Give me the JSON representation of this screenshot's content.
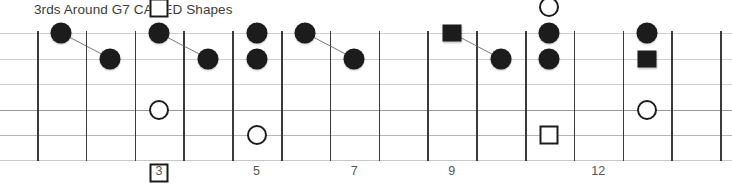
{
  "title": "3rds Around G7 CAGED Shapes",
  "diagram": {
    "type": "guitar-fretboard",
    "fret_count": 14,
    "string_count": 6,
    "fret_x0": 37,
    "fret_spacing": 48.8,
    "string_y": [
      33,
      58.5,
      84,
      110,
      135,
      160
    ],
    "board_top": 31,
    "board_bottom": 161,
    "colors": {
      "marker_fill": "#1c1c1c",
      "marker_outline": "#1c1c1c",
      "fret_line": "#3a3a3a",
      "string_line": "#cfcfcf",
      "title_text": "#3c3c3c",
      "fretnum_text": "#555555",
      "background": "#ffffff"
    },
    "fret_numbers": [
      {
        "label": "3",
        "fret": 3
      },
      {
        "label": "5",
        "fret": 5
      },
      {
        "label": "7",
        "fret": 7
      },
      {
        "label": "9",
        "fret": 9
      },
      {
        "label": "12",
        "fret": 12
      }
    ],
    "markers": [
      {
        "name": "filled-circle-f1-s1",
        "fret": 1,
        "string": 1,
        "shape": "circle-filled",
        "offset_y": 0
      },
      {
        "name": "filled-circle-f2-s2",
        "fret": 2,
        "string": 2,
        "shape": "circle-filled",
        "offset_y": 0
      },
      {
        "name": "open-square-f3-above",
        "fret": 3,
        "string": 1,
        "shape": "square-open",
        "offset_y": -25
      },
      {
        "name": "filled-circle-f3-s1",
        "fret": 3,
        "string": 1,
        "shape": "circle-filled",
        "offset_y": 0
      },
      {
        "name": "open-circle-f3-s4",
        "fret": 3,
        "string": 4,
        "shape": "circle-open",
        "offset_y": 0
      },
      {
        "name": "open-square-f3-below",
        "fret": 3,
        "string": 6,
        "shape": "square-open",
        "offset_y": 13
      },
      {
        "name": "filled-circle-f4-s2",
        "fret": 4,
        "string": 2,
        "shape": "circle-filled",
        "offset_y": 0
      },
      {
        "name": "filled-circle-f5-s1",
        "fret": 5,
        "string": 1,
        "shape": "circle-filled",
        "offset_y": 0
      },
      {
        "name": "filled-circle-f5-s2",
        "fret": 5,
        "string": 2,
        "shape": "circle-filled",
        "offset_y": 0
      },
      {
        "name": "open-circle-f5-s5",
        "fret": 5,
        "string": 5,
        "shape": "circle-open",
        "offset_y": 0
      },
      {
        "name": "filled-circle-f6-s1",
        "fret": 6,
        "string": 1,
        "shape": "circle-filled",
        "offset_y": 0
      },
      {
        "name": "filled-circle-f7-s2",
        "fret": 7,
        "string": 2,
        "shape": "circle-filled",
        "offset_y": 0
      },
      {
        "name": "filled-square-f9-s1",
        "fret": 9,
        "string": 1,
        "shape": "square-filled",
        "offset_y": 0
      },
      {
        "name": "filled-circle-f10-s2",
        "fret": 10,
        "string": 2,
        "shape": "circle-filled",
        "offset_y": 0
      },
      {
        "name": "open-circle-f11-above",
        "fret": 11,
        "string": 1,
        "shape": "circle-open",
        "offset_y": -26
      },
      {
        "name": "filled-circle-f11-s1",
        "fret": 11,
        "string": 1,
        "shape": "circle-filled",
        "offset_y": 0
      },
      {
        "name": "filled-circle-f11-s2",
        "fret": 11,
        "string": 2,
        "shape": "circle-filled",
        "offset_y": 0
      },
      {
        "name": "open-square-f11-s5",
        "fret": 11,
        "string": 5,
        "shape": "square-open",
        "offset_y": 0
      },
      {
        "name": "filled-circle-f13-s1",
        "fret": 13,
        "string": 1,
        "shape": "circle-filled",
        "offset_y": 0
      },
      {
        "name": "filled-square-f13-s2",
        "fret": 13,
        "string": 2,
        "shape": "square-filled",
        "offset_y": 0
      },
      {
        "name": "open-circle-f13-s4",
        "fret": 13,
        "string": 4,
        "shape": "circle-open",
        "offset_y": 0
      }
    ],
    "connectors": [
      {
        "name": "connector-f1s1-f2s2",
        "from_fret": 1,
        "from_string": 1,
        "to_fret": 2,
        "to_string": 2
      },
      {
        "name": "connector-f3s1-f4s2",
        "from_fret": 3,
        "from_string": 1,
        "to_fret": 4,
        "to_string": 2
      },
      {
        "name": "connector-f6s1-f7s2",
        "from_fret": 6,
        "from_string": 1,
        "to_fret": 7,
        "to_string": 2
      },
      {
        "name": "connector-f9s1-f10s2",
        "from_fret": 9,
        "from_string": 1,
        "to_fret": 10,
        "to_string": 2
      }
    ]
  }
}
